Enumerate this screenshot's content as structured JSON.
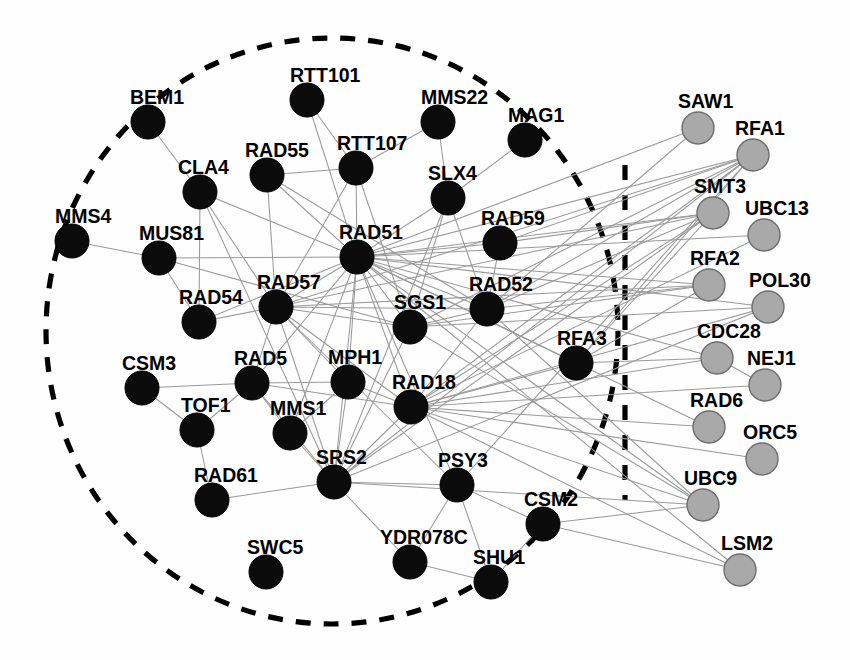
{
  "figure": {
    "title": "",
    "type": "node-link-network-graph",
    "width": 850,
    "height": 660,
    "background_color": "#ffffff"
  },
  "chart_data": {
    "type": "scatter",
    "title": "",
    "xlabel": "",
    "ylabel": "",
    "legend_position": "none",
    "grid": false,
    "node_radius_black": 17,
    "node_radius_gray": 16,
    "colors": {
      "black_node_fill": "#0b0b0b",
      "gray_node_fill": "#a9a9a9",
      "gray_node_stroke": "#6d6d6d",
      "edge": "#9a9a9a",
      "boundary": "#000000"
    },
    "groups": [
      {
        "id": "inner",
        "style": "black",
        "enclosed_by": "dashed-oval"
      },
      {
        "id": "outer",
        "style": "gray",
        "enclosed_by": "none"
      }
    ],
    "nodes": [
      {
        "id": "BEM1",
        "label": "BEM1",
        "x": 148,
        "y": 122,
        "group": "inner",
        "label_x": 130,
        "label_y": 104
      },
      {
        "id": "RTT101",
        "label": "RTT101",
        "x": 307,
        "y": 100,
        "group": "inner",
        "label_x": 290,
        "label_y": 82
      },
      {
        "id": "MMS22",
        "label": "MMS22",
        "x": 438,
        "y": 122,
        "group": "inner",
        "label_x": 421,
        "label_y": 104
      },
      {
        "id": "MAG1",
        "label": "MAG1",
        "x": 525,
        "y": 140,
        "group": "inner",
        "label_x": 508,
        "label_y": 122
      },
      {
        "id": "CLA4",
        "label": "CLA4",
        "x": 200,
        "y": 192,
        "group": "inner",
        "label_x": 178,
        "label_y": 174
      },
      {
        "id": "RAD55",
        "label": "RAD55",
        "x": 267,
        "y": 175,
        "group": "inner",
        "label_x": 245,
        "label_y": 157
      },
      {
        "id": "RTT107",
        "label": "RTT107",
        "x": 356,
        "y": 168,
        "group": "inner",
        "label_x": 337,
        "label_y": 150
      },
      {
        "id": "SLX4",
        "label": "SLX4",
        "x": 448,
        "y": 198,
        "group": "inner",
        "label_x": 428,
        "label_y": 180
      },
      {
        "id": "MMS4",
        "label": "MMS4",
        "x": 72,
        "y": 241,
        "group": "inner",
        "label_x": 55,
        "label_y": 223
      },
      {
        "id": "MUS81",
        "label": "MUS81",
        "x": 159,
        "y": 258,
        "group": "inner",
        "label_x": 139,
        "label_y": 240
      },
      {
        "id": "RAD51",
        "label": "RAD51",
        "x": 357,
        "y": 257,
        "group": "inner",
        "label_x": 339,
        "label_y": 239
      },
      {
        "id": "RAD59",
        "label": "RAD59",
        "x": 500,
        "y": 243,
        "group": "inner",
        "label_x": 481,
        "label_y": 225
      },
      {
        "id": "RAD54",
        "label": "RAD54",
        "x": 199,
        "y": 322,
        "group": "inner",
        "label_x": 179,
        "label_y": 304
      },
      {
        "id": "RAD57",
        "label": "RAD57",
        "x": 276,
        "y": 307,
        "group": "inner",
        "label_x": 257,
        "label_y": 289
      },
      {
        "id": "SGS1",
        "label": "SGS1",
        "x": 410,
        "y": 327,
        "group": "inner",
        "label_x": 394,
        "label_y": 309
      },
      {
        "id": "RAD52",
        "label": "RAD52",
        "x": 487,
        "y": 309,
        "group": "inner",
        "label_x": 469,
        "label_y": 291
      },
      {
        "id": "RFA3",
        "label": "RFA3",
        "x": 576,
        "y": 363,
        "group": "inner",
        "label_x": 557,
        "label_y": 345
      },
      {
        "id": "CSM3",
        "label": "CSM3",
        "x": 142,
        "y": 388,
        "group": "inner",
        "label_x": 122,
        "label_y": 370
      },
      {
        "id": "RAD5",
        "label": "RAD5",
        "x": 252,
        "y": 383,
        "group": "inner",
        "label_x": 234,
        "label_y": 365
      },
      {
        "id": "MPH1",
        "label": "MPH1",
        "x": 348,
        "y": 382,
        "group": "inner",
        "label_x": 328,
        "label_y": 364
      },
      {
        "id": "RAD18",
        "label": "RAD18",
        "x": 411,
        "y": 407,
        "group": "inner",
        "label_x": 392,
        "label_y": 389
      },
      {
        "id": "TOF1",
        "label": "TOF1",
        "x": 197,
        "y": 430,
        "group": "inner",
        "label_x": 181,
        "label_y": 412
      },
      {
        "id": "MMS1",
        "label": "MMS1",
        "x": 290,
        "y": 433,
        "group": "inner",
        "label_x": 270,
        "label_y": 415
      },
      {
        "id": "SRS2",
        "label": "SRS2",
        "x": 334,
        "y": 482,
        "group": "inner",
        "label_x": 316,
        "label_y": 464
      },
      {
        "id": "PSY3",
        "label": "PSY3",
        "x": 457,
        "y": 485,
        "group": "inner",
        "label_x": 438,
        "label_y": 467
      },
      {
        "id": "RAD61",
        "label": "RAD61",
        "x": 212,
        "y": 500,
        "group": "inner",
        "label_x": 194,
        "label_y": 482
      },
      {
        "id": "CSM2",
        "label": "CSM2",
        "x": 543,
        "y": 524,
        "group": "inner",
        "label_x": 524,
        "label_y": 506
      },
      {
        "id": "YDR078C",
        "label": "YDR078C",
        "x": 410,
        "y": 562,
        "group": "inner",
        "label_x": 380,
        "label_y": 544
      },
      {
        "id": "SHU1",
        "label": "SHU1",
        "x": 491,
        "y": 582,
        "group": "inner",
        "label_x": 473,
        "label_y": 564
      },
      {
        "id": "SWC5",
        "label": "SWC5",
        "x": 266,
        "y": 572,
        "group": "inner",
        "label_x": 247,
        "label_y": 554
      },
      {
        "id": "SAW1",
        "label": "SAW1",
        "x": 698,
        "y": 128,
        "group": "outer",
        "label_x": 678,
        "label_y": 108
      },
      {
        "id": "RFA1",
        "label": "RFA1",
        "x": 753,
        "y": 155,
        "group": "outer",
        "label_x": 735,
        "label_y": 135
      },
      {
        "id": "SMT3",
        "label": "SMT3",
        "x": 713,
        "y": 213,
        "group": "outer",
        "label_x": 694,
        "label_y": 193
      },
      {
        "id": "UBC13",
        "label": "UBC13",
        "x": 764,
        "y": 235,
        "group": "outer",
        "label_x": 745,
        "label_y": 215
      },
      {
        "id": "RFA2",
        "label": "RFA2",
        "x": 709,
        "y": 285,
        "group": "outer",
        "label_x": 690,
        "label_y": 265
      },
      {
        "id": "POL30",
        "label": "POL30",
        "x": 768,
        "y": 307,
        "group": "outer",
        "label_x": 749,
        "label_y": 287
      },
      {
        "id": "CDC28",
        "label": "CDC28",
        "x": 717,
        "y": 358,
        "group": "outer",
        "label_x": 697,
        "label_y": 338
      },
      {
        "id": "NEJ1",
        "label": "NEJ1",
        "x": 765,
        "y": 385,
        "group": "outer",
        "label_x": 747,
        "label_y": 365
      },
      {
        "id": "RAD6",
        "label": "RAD6",
        "x": 709,
        "y": 427,
        "group": "outer",
        "label_x": 690,
        "label_y": 407
      },
      {
        "id": "ORC5",
        "label": "ORC5",
        "x": 762,
        "y": 459,
        "group": "outer",
        "label_x": 743,
        "label_y": 439
      },
      {
        "id": "UBC9",
        "label": "UBC9",
        "x": 703,
        "y": 505,
        "group": "outer",
        "label_x": 684,
        "label_y": 485
      },
      {
        "id": "LSM2",
        "label": "LSM2",
        "x": 740,
        "y": 570,
        "group": "outer",
        "label_x": 721,
        "label_y": 550
      }
    ],
    "edges": [
      [
        "BEM1",
        "CLA4"
      ],
      [
        "CLA4",
        "RAD51"
      ],
      [
        "CLA4",
        "RAD57"
      ],
      [
        "CLA4",
        "SRS2"
      ],
      [
        "CLA4",
        "RAD54"
      ],
      [
        "RTT101",
        "RAD51"
      ],
      [
        "RTT101",
        "RTT107"
      ],
      [
        "RTT107",
        "RAD55"
      ],
      [
        "RTT107",
        "RAD51"
      ],
      [
        "RTT107",
        "RAD57"
      ],
      [
        "RTT107",
        "SGS1"
      ],
      [
        "MMS22",
        "SLX4"
      ],
      [
        "MMS22",
        "RTT107"
      ],
      [
        "MAG1",
        "SLX4"
      ],
      [
        "RAD55",
        "RAD51"
      ],
      [
        "RAD55",
        "RAD57"
      ],
      [
        "RAD55",
        "RAD52"
      ],
      [
        "SLX4",
        "RAD51"
      ],
      [
        "SLX4",
        "SGS1"
      ],
      [
        "SLX4",
        "RAD52"
      ],
      [
        "SLX4",
        "SRS2"
      ],
      [
        "MMS4",
        "MUS81"
      ],
      [
        "MUS81",
        "RAD51"
      ],
      [
        "MUS81",
        "RAD54"
      ],
      [
        "MUS81",
        "SGS1"
      ],
      [
        "RAD51",
        "RAD54"
      ],
      [
        "RAD51",
        "RAD57"
      ],
      [
        "RAD51",
        "RAD52"
      ],
      [
        "RAD51",
        "RAD59"
      ],
      [
        "RAD51",
        "SGS1"
      ],
      [
        "RAD51",
        "RAD5"
      ],
      [
        "RAD51",
        "MPH1"
      ],
      [
        "RAD51",
        "RAD18"
      ],
      [
        "RAD51",
        "SRS2"
      ],
      [
        "RAD51",
        "PSY3"
      ],
      [
        "RAD51",
        "MMS1"
      ],
      [
        "RAD51",
        "RFA3"
      ],
      [
        "RAD51",
        "RFA1"
      ],
      [
        "RAD51",
        "RFA2"
      ],
      [
        "RAD51",
        "SMT3"
      ],
      [
        "RAD51",
        "UBC13"
      ],
      [
        "RAD51",
        "POL30"
      ],
      [
        "RAD51",
        "CDC28"
      ],
      [
        "RAD51",
        "RAD6"
      ],
      [
        "RAD51",
        "UBC9"
      ],
      [
        "RAD51",
        "LSM2"
      ],
      [
        "RAD51",
        "SAW1"
      ],
      [
        "RAD59",
        "RAD52"
      ],
      [
        "RAD54",
        "RAD57"
      ],
      [
        "RAD57",
        "RAD52"
      ],
      [
        "RAD57",
        "SGS1"
      ],
      [
        "RAD57",
        "MPH1"
      ],
      [
        "RAD57",
        "SRS2"
      ],
      [
        "RAD57",
        "RAD5"
      ],
      [
        "RAD57",
        "RAD18"
      ],
      [
        "RAD57",
        "RFA1"
      ],
      [
        "RAD57",
        "RFA2"
      ],
      [
        "RAD57",
        "SMT3"
      ],
      [
        "RAD57",
        "PSY3"
      ],
      [
        "RAD52",
        "RFA1"
      ],
      [
        "RAD52",
        "RFA2"
      ],
      [
        "RAD52",
        "SMT3"
      ],
      [
        "RAD52",
        "UBC9"
      ],
      [
        "RAD52",
        "RAD18"
      ],
      [
        "SGS1",
        "RAD52"
      ],
      [
        "SGS1",
        "SRS2"
      ],
      [
        "SGS1",
        "RFA1"
      ],
      [
        "SGS1",
        "RFA2"
      ],
      [
        "SGS1",
        "POL30"
      ],
      [
        "SGS1",
        "UBC9"
      ],
      [
        "CSM3",
        "TOF1"
      ],
      [
        "CSM3",
        "RAD5"
      ],
      [
        "TOF1",
        "RAD61"
      ],
      [
        "TOF1",
        "RAD5"
      ],
      [
        "RAD5",
        "MMS1"
      ],
      [
        "RAD5",
        "MPH1"
      ],
      [
        "RAD5",
        "SRS2"
      ],
      [
        "RAD5",
        "RAD18"
      ],
      [
        "MPH1",
        "SRS2"
      ],
      [
        "MPH1",
        "RAD18"
      ],
      [
        "MMS1",
        "SRS2"
      ],
      [
        "MMS1",
        "MPH1"
      ],
      [
        "RAD61",
        "SRS2"
      ],
      [
        "SRS2",
        "PSY3"
      ],
      [
        "SRS2",
        "RAD18"
      ],
      [
        "SRS2",
        "YDR078C"
      ],
      [
        "SRS2",
        "POL30"
      ],
      [
        "SRS2",
        "SMT3"
      ],
      [
        "SRS2",
        "RFA1"
      ],
      [
        "SRS2",
        "UBC9"
      ],
      [
        "RAD18",
        "RFA3"
      ],
      [
        "RAD18",
        "RAD6"
      ],
      [
        "RAD18",
        "UBC13"
      ],
      [
        "RAD18",
        "POL30"
      ],
      [
        "RAD18",
        "SMT3"
      ],
      [
        "RAD18",
        "RFA1"
      ],
      [
        "RAD18",
        "UBC9"
      ],
      [
        "RAD18",
        "LSM2"
      ],
      [
        "RAD18",
        "NEJ1"
      ],
      [
        "RAD18",
        "CDC28"
      ],
      [
        "RAD18",
        "ORC5"
      ],
      [
        "PSY3",
        "YDR078C"
      ],
      [
        "PSY3",
        "SHU1"
      ],
      [
        "PSY3",
        "CSM2"
      ],
      [
        "PSY3",
        "RFA1"
      ],
      [
        "YDR078C",
        "SHU1"
      ],
      [
        "CSM2",
        "SHU1"
      ],
      [
        "CSM2",
        "UBC9"
      ],
      [
        "RFA3",
        "RFA1"
      ],
      [
        "RFA3",
        "RFA2"
      ],
      [
        "RFA3",
        "SMT3"
      ],
      [
        "RFA3",
        "CDC28"
      ],
      [
        "RAD59",
        "RFA1"
      ],
      [
        "RAD59",
        "SMT3"
      ],
      [
        "SAW1",
        "RAD52"
      ],
      [
        "NEJ1",
        "CDC28"
      ],
      [
        "CSM2",
        "LSM2"
      ]
    ],
    "annotations": [
      {
        "type": "dashed-oval",
        "name": "inner-group-boundary",
        "cx": 332,
        "cy": 331,
        "rx": 286,
        "ry": 293
      },
      {
        "type": "dashed-line",
        "name": "vertical-group-divider",
        "x": 625,
        "y1": 165,
        "y2": 500
      }
    ]
  }
}
